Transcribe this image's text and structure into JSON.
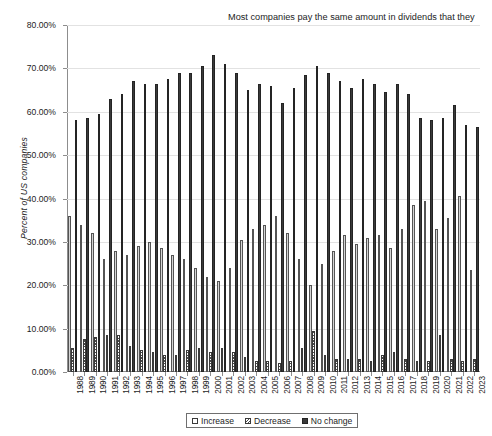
{
  "chart_data": {
    "type": "bar",
    "title": "",
    "xlabel": "",
    "ylabel": "Percent of US companies",
    "ylim": [
      0,
      80
    ],
    "ytick_values": [
      0,
      10,
      20,
      30,
      40,
      50,
      60,
      70,
      80
    ],
    "ytick_labels": [
      "0.00%",
      "10.00%",
      "20.00%",
      "30.00%",
      "40.00%",
      "50.00%",
      "60.00%",
      "70.00%",
      "80.00%"
    ],
    "grid": true,
    "legend_position": "bottom-center",
    "categories": [
      "1988",
      "1989",
      "1990",
      "1991",
      "1992",
      "1993",
      "1994",
      "1995",
      "1996",
      "1997",
      "1998",
      "1999",
      "2000",
      "2001",
      "2002",
      "2003",
      "2004",
      "2005",
      "2006",
      "2007",
      "2008",
      "2009",
      "2010",
      "2011",
      "2012",
      "2013",
      "2014",
      "2015",
      "2016",
      "2017",
      "2018",
      "2019",
      "2020",
      "2021",
      "2022",
      "2023"
    ],
    "series": [
      {
        "name": "Increase",
        "values": [
          36.0,
          34.0,
          32.0,
          26.0,
          28.0,
          27.0,
          29.0,
          30.0,
          28.5,
          27.0,
          26.0,
          24.0,
          22.0,
          21.0,
          24.0,
          30.5,
          33.0,
          34.0,
          36.0,
          32.0,
          26.0,
          20.0,
          25.0,
          28.0,
          31.5,
          29.5,
          31.0,
          31.5,
          28.5,
          33.0,
          38.5,
          39.5,
          33.0,
          35.5,
          40.5,
          23.5
        ]
      },
      {
        "name": "Decrease",
        "values": [
          5.5,
          7.5,
          8.0,
          8.5,
          8.5,
          6.0,
          5.0,
          4.5,
          4.0,
          4.0,
          5.0,
          5.5,
          4.5,
          5.5,
          4.5,
          3.5,
          2.5,
          2.5,
          2.0,
          2.5,
          5.5,
          9.5,
          4.0,
          3.0,
          3.0,
          3.0,
          2.5,
          4.0,
          4.5,
          3.0,
          2.5,
          2.5,
          8.5,
          3.0,
          2.5,
          3.0
        ]
      },
      {
        "name": "No change",
        "values": [
          58.0,
          58.5,
          59.5,
          63.0,
          64.0,
          67.0,
          66.5,
          66.5,
          67.5,
          69.0,
          69.0,
          70.5,
          73.0,
          71.0,
          69.0,
          65.0,
          66.5,
          66.0,
          62.0,
          65.5,
          68.5,
          70.5,
          69.0,
          67.0,
          65.5,
          67.5,
          66.5,
          64.5,
          66.5,
          64.0,
          58.5,
          58.0,
          58.5,
          61.5,
          57.0,
          56.5
        ]
      }
    ],
    "annotation": "Most companies pay the same amount in dividends that they did in the previous year. Whey they change dividends, they are far more likely to increase than decrease dividends."
  },
  "legend": {
    "items": [
      {
        "label": "Increase",
        "swatch": "light-open-square"
      },
      {
        "label": "Decrease",
        "swatch": "hatched-square"
      },
      {
        "label": "No change",
        "swatch": "dark-filled-square"
      }
    ]
  },
  "colors": {
    "increase": "#d4d4d4",
    "decrease": "#4a4a4a",
    "no_change": "#3a3a3a",
    "axis": "#8d8d8d",
    "grid": "#e2e2e2",
    "text": "#1d1d1d",
    "background": "#ffffff"
  }
}
